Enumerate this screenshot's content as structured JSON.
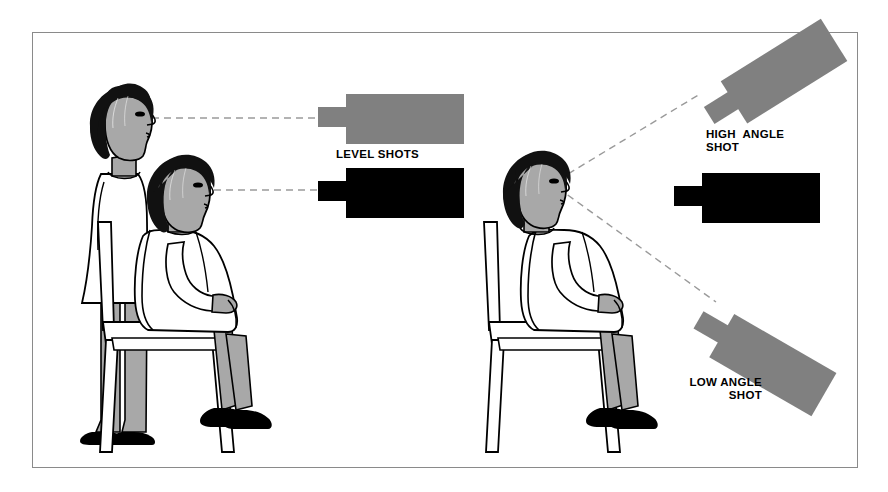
{
  "figure": {
    "border_color": "#8a8a8a",
    "background": "#ffffff"
  },
  "palette": {
    "ink": "#000000",
    "gray_camera": "#808080",
    "black_camera": "#000000",
    "skin_shade": "#a8a8a8",
    "dashed_line": "#9a9a9a",
    "paper": "#ffffff"
  },
  "labels": {
    "level_shots": "LEVEL SHOTS",
    "high_angle": "HIGH  ANGLE\nSHOT",
    "low_angle": "LOW ANGLE\nSHOT"
  },
  "panels": [
    {
      "name": "left-panel",
      "concept": "level shots",
      "subjects": [
        {
          "name": "standing-girl",
          "pose": "standing",
          "eye_level_y": 118
        },
        {
          "name": "seated-girl",
          "pose": "seated",
          "eye_level_y": 190
        }
      ],
      "cameras": [
        {
          "name": "camera-level-standing",
          "fill": "#808080",
          "angle_deg": 0,
          "aimed_at": "standing-girl-eye"
        },
        {
          "name": "camera-level-seated",
          "fill": "#000000",
          "angle_deg": 0,
          "aimed_at": "seated-girl-eye"
        }
      ],
      "sight_lines": [
        {
          "name": "sight-line-standing",
          "from": [
            152,
            118
          ],
          "to": [
            318,
            118
          ],
          "style": "dashed"
        },
        {
          "name": "sight-line-seated",
          "from": [
            176,
            190
          ],
          "to": [
            318,
            190
          ],
          "style": "dashed"
        }
      ]
    },
    {
      "name": "right-panel",
      "concept": "high and low angle shots",
      "subjects": [
        {
          "name": "seated-girl-right",
          "pose": "seated",
          "eye_level_y": 183
        }
      ],
      "cameras": [
        {
          "name": "camera-high-angle",
          "fill": "#808080",
          "angle_deg": -32,
          "aimed_at": "seated-girl-right-eye"
        },
        {
          "name": "camera-level-right",
          "fill": "#000000",
          "angle_deg": 0,
          "aimed_at": "seated-girl-right-eye"
        },
        {
          "name": "camera-low-angle",
          "fill": "#808080",
          "angle_deg": 30,
          "aimed_at": "seated-girl-right-eye"
        }
      ],
      "sight_lines": [
        {
          "name": "sight-line-high",
          "from": [
            556,
            181
          ],
          "to": [
            697,
            96
          ],
          "style": "dashed"
        },
        {
          "name": "sight-line-low",
          "from": [
            556,
            187
          ],
          "to": [
            712,
            300
          ],
          "style": "dashed"
        }
      ]
    }
  ]
}
